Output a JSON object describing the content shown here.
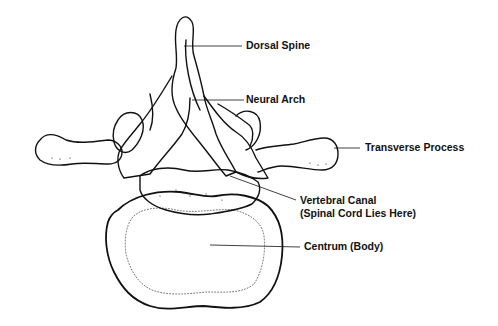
{
  "diagram": {
    "labels": {
      "dorsal_spine": "Dorsal Spine",
      "neural_arch": "Neural Arch",
      "transverse_process": "Transverse Process",
      "vertebral_canal": "Vertebral Canal",
      "vertebral_canal_note": "(Spinal Cord Lies Here)",
      "centrum": "Centrum (Body)"
    },
    "colors": {
      "ink": "#111111",
      "background": "#ffffff"
    }
  }
}
